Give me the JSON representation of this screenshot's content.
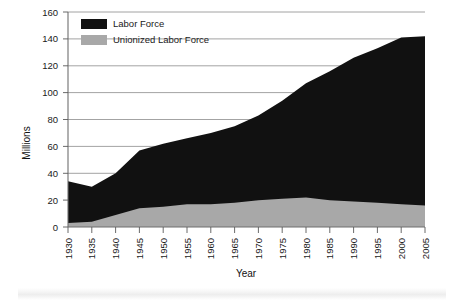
{
  "chart": {
    "title": "",
    "xlabel": "Year",
    "ylabel": "Millions",
    "legend": {
      "items": [
        {
          "label": "Labor Force",
          "color": "#111111"
        },
        {
          "label": "Unionized Labor Force",
          "color": "#a8a8a8"
        }
      ]
    },
    "yticks": [
      "0",
      "20",
      "40",
      "60",
      "80",
      "100",
      "120",
      "140",
      "160"
    ],
    "xticks": [
      "1930",
      "1935",
      "1940",
      "1945",
      "1950",
      "1955",
      "1960",
      "1965",
      "1970",
      "1975",
      "1980",
      "1985",
      "1990",
      "1995",
      "2000",
      "2005"
    ]
  },
  "chart_data": {
    "type": "area",
    "stacked": false,
    "title": "",
    "xlabel": "Year",
    "ylabel": "Millions",
    "xlim": [
      1930,
      2005
    ],
    "ylim": [
      0,
      160
    ],
    "grid": true,
    "legend_position": "top-left",
    "x": [
      1930,
      1935,
      1940,
      1945,
      1950,
      1955,
      1960,
      1965,
      1970,
      1975,
      1980,
      1985,
      1990,
      1995,
      2000,
      2005
    ],
    "series": [
      {
        "name": "Labor Force",
        "color": "#111111",
        "values": [
          34,
          30,
          40,
          57,
          62,
          66,
          70,
          75,
          83,
          94,
          107,
          116,
          126,
          133,
          141,
          142
        ]
      },
      {
        "name": "Unionized Labor Force",
        "color": "#a8a8a8",
        "values": [
          3,
          4,
          9,
          14,
          15,
          17,
          17,
          18,
          20,
          21,
          22,
          20,
          19,
          18,
          17,
          16
        ]
      }
    ]
  }
}
